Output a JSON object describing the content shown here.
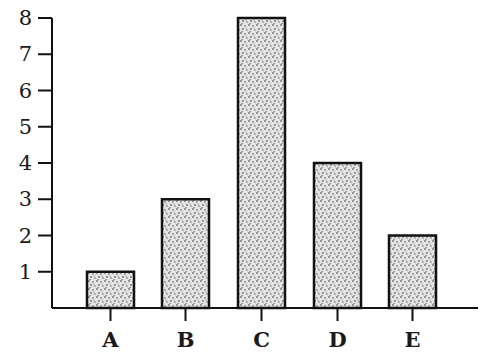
{
  "chart_data": {
    "type": "bar",
    "title": "",
    "xlabel": "",
    "ylabel": "",
    "categories": [
      "A",
      "B",
      "C",
      "D",
      "E"
    ],
    "values": [
      1,
      3,
      8,
      4,
      2
    ],
    "ylim": [
      0,
      8
    ],
    "yticks": [
      1,
      2,
      3,
      4,
      5,
      6,
      7,
      8
    ],
    "grid": false,
    "legend": null,
    "bar_fill": "stippled gray texture",
    "bar_edge_color": "#111111"
  }
}
